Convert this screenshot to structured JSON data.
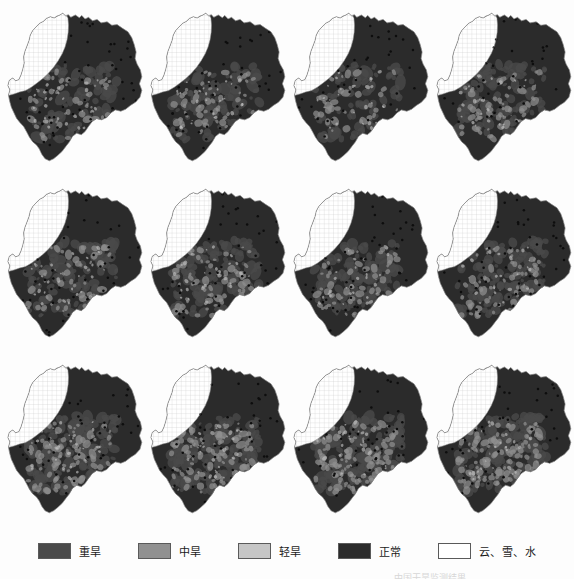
{
  "figure": {
    "kind": "drought-monitoring-map-series",
    "columns": 4,
    "rows": 3,
    "panel_count": 12,
    "background_color": "#fdfdfd",
    "bottom_caption_partial": "中国干旱监测结果"
  },
  "legend": {
    "items": [
      {
        "label": "重旱",
        "color": "#4a4a4a",
        "border": "#5a5a5a",
        "pattern": "solid",
        "name": "severe-drought"
      },
      {
        "label": "中旱",
        "color": "#919191",
        "border": "#5a5a5a",
        "pattern": "solid",
        "name": "moderate-drought"
      },
      {
        "label": "轻旱",
        "color": "#c6c6c6",
        "border": "#5a5a5a",
        "pattern": "solid",
        "name": "light-drought"
      },
      {
        "label": "正常",
        "color": "#2b2b2b",
        "border": "#5a5a5a",
        "pattern": "solid",
        "name": "normal"
      },
      {
        "label": "云、雪、水",
        "color": "#ffffff",
        "border": "#5a5a5a",
        "pattern": "none",
        "name": "cloud-snow-water"
      }
    ]
  },
  "palette": {
    "severe": "#4a4a4a",
    "moderate": "#8f8f8f",
    "light": "#c4c4c4",
    "normal": "#2b2b2b",
    "cloud_snow_water": "#ffffff",
    "outline": "#8c8c8c",
    "grid_line": "#c9c9c9",
    "station_dot": "#0d0d0d",
    "page_background": "#fdfdfd"
  },
  "panels": [
    {
      "id": "panel-1",
      "row": 1,
      "col": 1,
      "normal_fraction": 0.78,
      "severe_fraction": 0.14,
      "moderate_fraction": 0.06,
      "light_fraction": 0.02,
      "grid_region": "north-west"
    },
    {
      "id": "panel-2",
      "row": 1,
      "col": 2,
      "normal_fraction": 0.76,
      "severe_fraction": 0.15,
      "moderate_fraction": 0.07,
      "light_fraction": 0.02,
      "grid_region": "north-west"
    },
    {
      "id": "panel-3",
      "row": 1,
      "col": 3,
      "normal_fraction": 0.8,
      "severe_fraction": 0.13,
      "moderate_fraction": 0.05,
      "light_fraction": 0.02,
      "grid_region": "north-west"
    },
    {
      "id": "panel-4",
      "row": 1,
      "col": 4,
      "normal_fraction": 0.72,
      "severe_fraction": 0.18,
      "moderate_fraction": 0.08,
      "light_fraction": 0.02,
      "grid_region": "north-west"
    },
    {
      "id": "panel-5",
      "row": 2,
      "col": 1,
      "normal_fraction": 0.74,
      "severe_fraction": 0.17,
      "moderate_fraction": 0.07,
      "light_fraction": 0.02,
      "grid_region": "north-west"
    },
    {
      "id": "panel-6",
      "row": 2,
      "col": 2,
      "normal_fraction": 0.71,
      "severe_fraction": 0.19,
      "moderate_fraction": 0.08,
      "light_fraction": 0.02,
      "grid_region": "north-west"
    },
    {
      "id": "panel-7",
      "row": 2,
      "col": 3,
      "normal_fraction": 0.73,
      "severe_fraction": 0.18,
      "moderate_fraction": 0.07,
      "light_fraction": 0.02,
      "grid_region": "north-west"
    },
    {
      "id": "panel-8",
      "row": 2,
      "col": 4,
      "normal_fraction": 0.7,
      "severe_fraction": 0.2,
      "moderate_fraction": 0.08,
      "light_fraction": 0.02,
      "grid_region": "north-west"
    },
    {
      "id": "panel-9",
      "row": 3,
      "col": 1,
      "normal_fraction": 0.62,
      "severe_fraction": 0.24,
      "moderate_fraction": 0.12,
      "light_fraction": 0.02,
      "grid_region": "north-west"
    },
    {
      "id": "panel-10",
      "row": 3,
      "col": 2,
      "normal_fraction": 0.6,
      "severe_fraction": 0.25,
      "moderate_fraction": 0.13,
      "light_fraction": 0.02,
      "grid_region": "north-west"
    },
    {
      "id": "panel-11",
      "row": 3,
      "col": 3,
      "normal_fraction": 0.58,
      "severe_fraction": 0.26,
      "moderate_fraction": 0.14,
      "light_fraction": 0.02,
      "grid_region": "north-west"
    },
    {
      "id": "panel-12",
      "row": 3,
      "col": 4,
      "normal_fraction": 0.56,
      "severe_fraction": 0.27,
      "moderate_fraction": 0.15,
      "light_fraction": 0.02,
      "grid_region": "north-west"
    }
  ]
}
